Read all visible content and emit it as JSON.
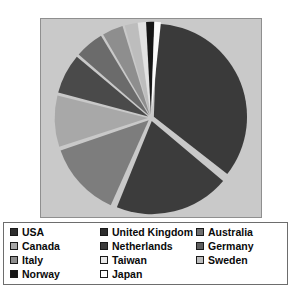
{
  "chart_data": {
    "type": "pie",
    "title": "",
    "subtitle": "",
    "xlabel": "",
    "ylabel": "",
    "legend_position": "bottom",
    "grid": false,
    "start_angle_deg": 0,
    "direction": "clockwise",
    "categories": [
      "USA",
      "United Kingdom",
      "Australia",
      "Canada",
      "Netherlands",
      "Germany",
      "Italy",
      "Sweden",
      "Taiwan",
      "Norway",
      "Japan"
    ],
    "values": [
      35.0,
      20.0,
      13.0,
      9.0,
      7.0,
      5.0,
      4.0,
      2.5,
      1.7,
      1.5,
      1.3
    ],
    "unit": "percent",
    "slices": [
      {
        "label": "USA",
        "value": 35.0,
        "color": "#3a3a3a",
        "exploded": true,
        "start_deg": 2,
        "sweep_deg": 126
      },
      {
        "label": "United Kingdom",
        "value": 20.0,
        "color": "#3c3c3c",
        "exploded": true,
        "start_deg": 130,
        "sweep_deg": 72
      },
      {
        "label": "Australia",
        "value": 13.0,
        "color": "#7d7d7d",
        "exploded": true,
        "start_deg": 204,
        "sweep_deg": 47
      },
      {
        "label": "Canada",
        "value": 9.0,
        "color": "#a8a8a8",
        "exploded": true,
        "start_deg": 252,
        "sweep_deg": 32
      },
      {
        "label": "Netherlands",
        "value": 7.0,
        "color": "#4a4a4a",
        "exploded": true,
        "start_deg": 285,
        "sweep_deg": 25
      },
      {
        "label": "Germany",
        "value": 5.0,
        "color": "#6b6b6b",
        "exploded": true,
        "start_deg": 311,
        "sweep_deg": 18
      },
      {
        "label": "Italy",
        "value": 4.0,
        "color": "#8e8e8e",
        "exploded": true,
        "start_deg": 330,
        "sweep_deg": 13
      },
      {
        "label": "Sweden",
        "value": 2.5,
        "color": "#bdbdbd",
        "exploded": true,
        "start_deg": 344,
        "sweep_deg": 8
      },
      {
        "label": "Taiwan",
        "value": 1.7,
        "color": "#e2e2e2",
        "exploded": true,
        "start_deg": 352,
        "sweep_deg": 5
      },
      {
        "label": "Norway",
        "value": 1.5,
        "color": "#161616",
        "exploded": true,
        "start_deg": 357,
        "sweep_deg": 5
      },
      {
        "label": "Japan",
        "value": 1.3,
        "color": "#fbfbfb",
        "exploded": true,
        "start_deg": 362,
        "sweep_deg": 4
      }
    ]
  },
  "chart": {
    "background_color": "#c9c9c9",
    "border_color": "#8f8f8f"
  },
  "legend": {
    "border_color": "#6d6d6d",
    "background_color": "#ffffff",
    "columns": [
      {
        "items": [
          {
            "label": "USA",
            "color": "#2e2e2e"
          },
          {
            "label": "Canada",
            "color": "#a8a8a8"
          },
          {
            "label": "Italy",
            "color": "#8e8e8e"
          },
          {
            "label": "Norway",
            "color": "#161616"
          }
        ]
      },
      {
        "items": [
          {
            "label": "United Kingdom",
            "color": "#2e2e2e"
          },
          {
            "label": "Netherlands",
            "color": "#3c3c3c"
          },
          {
            "label": "Taiwan",
            "color": "#e8e8e8"
          },
          {
            "label": "Japan",
            "color": "#fdfdfd"
          }
        ]
      },
      {
        "items": [
          {
            "label": "Australia",
            "color": "#6e6e6e"
          },
          {
            "label": "Germany",
            "color": "#5e5e5e"
          },
          {
            "label": "Sweden",
            "color": "#bdbdbd"
          }
        ]
      }
    ]
  }
}
